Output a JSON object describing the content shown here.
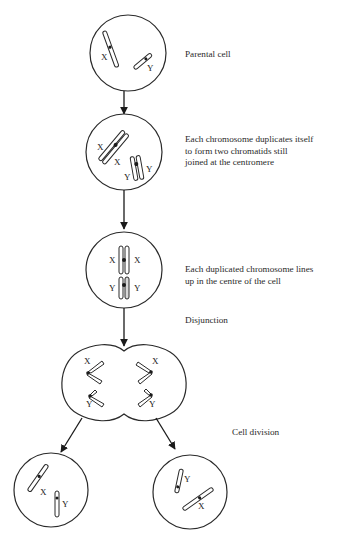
{
  "diagram": {
    "type": "meiosis/mitosis cell division flow",
    "stages": [
      {
        "id": "parental",
        "label": "Parental cell",
        "chromosomes": [
          "X",
          "Y"
        ]
      },
      {
        "id": "duplication",
        "label": "Each chromosome duplicates itself\nto form two chromatids still\njoined at the centromere",
        "chromosomes": [
          "X",
          "X",
          "Y",
          "Y"
        ]
      },
      {
        "id": "alignment",
        "label": "Each duplicated chromosome lines\nup in the centre of the cell",
        "chromosomes": [
          "X",
          "X",
          "Y",
          "Y"
        ]
      },
      {
        "id": "disjunction",
        "label": "Disjunction",
        "chromosomes": [
          "X",
          "X",
          "Y",
          "Y"
        ]
      },
      {
        "id": "division",
        "label": "Cell division",
        "daughters": [
          [
            "X",
            "Y"
          ],
          [
            "Y",
            "X"
          ]
        ]
      }
    ],
    "chromosome_labels": {
      "x": "X",
      "y": "Y"
    }
  }
}
